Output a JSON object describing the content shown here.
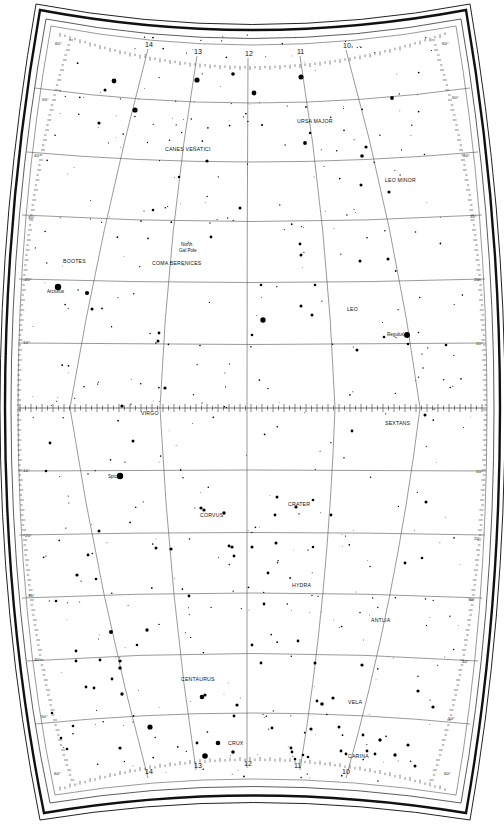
{
  "map": {
    "type": "star-chart",
    "region": "RA 10h-14h, Dec +60 to -60",
    "hour_labels": [
      "14",
      "13",
      "12",
      "11",
      "10"
    ],
    "dec_labels_north": [
      "60°",
      "50°",
      "40°",
      "30°",
      "20°",
      "10°"
    ],
    "dec_labels_south": [
      "10°",
      "20°",
      "30°",
      "40°",
      "50°",
      "60°"
    ],
    "constellations": [
      {
        "name": "CANES VENATICI",
        "x": 165,
        "y": 151
      },
      {
        "name": "URSA MAJOR",
        "x": 297,
        "y": 123
      },
      {
        "name": "LEO MINOR",
        "x": 385,
        "y": 182
      },
      {
        "name": "BOOTES",
        "x": 63,
        "y": 263
      },
      {
        "name": "COMA BERENICES",
        "x": 152,
        "y": 265
      },
      {
        "name": "LEO",
        "x": 347,
        "y": 311
      },
      {
        "name": "VIRGO",
        "x": 141,
        "y": 415
      },
      {
        "name": "SEXTANS",
        "x": 385,
        "y": 425
      },
      {
        "name": "CORVUS",
        "x": 200,
        "y": 517
      },
      {
        "name": "CRATER",
        "x": 288,
        "y": 506
      },
      {
        "name": "HYDRA",
        "x": 292,
        "y": 587
      },
      {
        "name": "ANTLIA",
        "x": 371,
        "y": 622
      },
      {
        "name": "CENTAURUS",
        "x": 181,
        "y": 681
      },
      {
        "name": "VELA",
        "x": 348,
        "y": 704
      },
      {
        "name": "CRUX",
        "x": 228,
        "y": 745
      },
      {
        "name": "CARINA",
        "x": 348,
        "y": 758
      }
    ],
    "named_stars": [
      {
        "name": "Arcturus",
        "x": 47,
        "y": 293
      },
      {
        "name": "Spica",
        "x": 108,
        "y": 478
      },
      {
        "name": "Regulus",
        "x": 387,
        "y": 336
      }
    ],
    "annotations": [
      {
        "text": "North",
        "x": 181,
        "y": 246
      },
      {
        "text": "Gal Pole",
        "x": 179,
        "y": 252
      }
    ],
    "stars": [
      [
        114,
        81,
        2.4
      ],
      [
        197,
        80,
        2.6
      ],
      [
        233,
        74,
        1.8
      ],
      [
        105,
        90,
        1.5
      ],
      [
        135,
        110,
        2.6
      ],
      [
        99,
        123,
        1.6
      ],
      [
        207,
        161,
        1.6
      ],
      [
        179,
        177,
        1.2
      ],
      [
        301,
        77,
        2.5
      ],
      [
        254,
        93,
        2.4
      ],
      [
        392,
        98,
        1.9
      ],
      [
        305,
        143,
        1.9
      ],
      [
        366,
        147,
        1.6
      ],
      [
        362,
        156,
        1.8
      ],
      [
        361,
        185,
        1.5
      ],
      [
        389,
        192,
        1.6
      ],
      [
        310,
        133,
        1.2
      ],
      [
        262,
        125,
        1.1
      ],
      [
        153,
        210,
        1.3
      ],
      [
        58,
        287,
        3.2
      ],
      [
        87,
        293,
        2.1
      ],
      [
        92,
        309,
        1.5
      ],
      [
        211,
        237,
        1.4
      ],
      [
        158,
        341,
        1.5
      ],
      [
        159,
        333,
        1.4
      ],
      [
        240,
        208,
        1.5
      ],
      [
        300,
        244,
        1.4
      ],
      [
        301,
        255,
        1.5
      ],
      [
        261,
        285,
        1.3
      ],
      [
        315,
        285,
        1.3
      ],
      [
        388,
        259,
        1.5
      ],
      [
        263,
        320,
        2.7
      ],
      [
        312,
        315,
        1.5
      ],
      [
        407,
        335,
        3.0
      ],
      [
        384,
        337,
        1.3
      ],
      [
        357,
        350,
        1.5
      ],
      [
        252,
        335,
        1.3
      ],
      [
        301,
        306,
        1.5
      ],
      [
        360,
        261,
        1.5
      ],
      [
        408,
        344,
        1.3
      ],
      [
        446,
        345,
        1.3
      ],
      [
        165,
        388,
        1.6
      ],
      [
        122,
        406,
        1.6
      ],
      [
        120,
        476,
        3.2
      ],
      [
        133,
        441,
        1.5
      ],
      [
        50,
        443,
        1.4
      ],
      [
        46,
        471,
        1.3
      ],
      [
        201,
        508,
        1.6
      ],
      [
        204,
        510,
        1.6
      ],
      [
        224,
        513,
        1.7
      ],
      [
        156,
        548,
        1.5
      ],
      [
        171,
        549,
        1.6
      ],
      [
        232,
        547,
        1.6
      ],
      [
        229,
        546,
        1.4
      ],
      [
        234,
        556,
        1.4
      ],
      [
        277,
        497,
        1.5
      ],
      [
        275,
        515,
        1.4
      ],
      [
        296,
        507,
        1.6
      ],
      [
        331,
        515,
        1.4
      ],
      [
        313,
        500,
        1.3
      ],
      [
        426,
        502,
        1.5
      ],
      [
        77,
        575,
        1.6
      ],
      [
        252,
        547,
        1.5
      ],
      [
        276,
        543,
        1.5
      ],
      [
        313,
        547,
        1.3
      ],
      [
        111,
        632,
        2.0
      ],
      [
        147,
        630,
        1.7
      ],
      [
        137,
        645,
        1.3
      ],
      [
        76,
        661,
        1.4
      ],
      [
        76,
        651,
        1.4
      ],
      [
        100,
        660,
        1.4
      ],
      [
        120,
        661,
        1.6
      ],
      [
        120,
        668,
        1.7
      ],
      [
        112,
        679,
        1.4
      ],
      [
        122,
        694,
        1.7
      ],
      [
        94,
        688,
        1.4
      ],
      [
        86,
        687,
        1.4
      ],
      [
        202,
        697,
        2.3
      ],
      [
        205,
        695,
        1.6
      ],
      [
        237,
        705,
        1.6
      ],
      [
        234,
        716,
        1.4
      ],
      [
        150,
        727,
        2.6
      ],
      [
        218,
        743,
        2.3
      ],
      [
        205,
        756,
        2.8
      ],
      [
        233,
        752,
        1.8
      ],
      [
        197,
        743,
        1.4
      ],
      [
        120,
        748,
        1.6
      ],
      [
        311,
        729,
        1.6
      ],
      [
        272,
        728,
        1.4
      ],
      [
        339,
        727,
        1.5
      ],
      [
        322,
        704,
        1.8
      ],
      [
        333,
        698,
        1.6
      ],
      [
        317,
        701,
        1.4
      ],
      [
        362,
        665,
        1.6
      ],
      [
        380,
        740,
        1.7
      ],
      [
        395,
        755,
        1.7
      ],
      [
        375,
        754,
        1.4
      ],
      [
        367,
        751,
        1.4
      ],
      [
        346,
        754,
        1.4
      ],
      [
        341,
        751,
        1.4
      ],
      [
        363,
        735,
        1.4
      ],
      [
        291,
        748,
        1.4
      ],
      [
        292,
        752,
        1.4
      ],
      [
        303,
        755,
        1.3
      ],
      [
        308,
        757,
        1.3
      ],
      [
        295,
        759,
        1.3
      ],
      [
        408,
        745,
        1.6
      ],
      [
        415,
        766,
        1.5
      ],
      [
        433,
        707,
        1.6
      ],
      [
        418,
        691,
        1.6
      ],
      [
        268,
        573,
        1.4
      ],
      [
        252,
        645,
        1.4
      ],
      [
        298,
        641,
        1.4
      ],
      [
        315,
        663,
        1.5
      ],
      [
        261,
        663,
        1.4
      ],
      [
        405,
        563,
        1.4
      ],
      [
        422,
        558,
        1.3
      ],
      [
        352,
        431,
        1.4
      ],
      [
        425,
        415,
        1.5
      ],
      [
        264,
        604,
        1.4
      ],
      [
        189,
        596,
        1.4
      ],
      [
        52,
        713,
        1.3
      ],
      [
        61,
        738,
        1.3
      ],
      [
        67,
        749,
        1.3
      ],
      [
        73,
        726,
        1.3
      ],
      [
        96,
        579,
        1.3
      ],
      [
        88,
        555,
        1.4
      ],
      [
        56,
        601,
        1.3
      ],
      [
        99,
        531,
        1.5
      ]
    ]
  }
}
